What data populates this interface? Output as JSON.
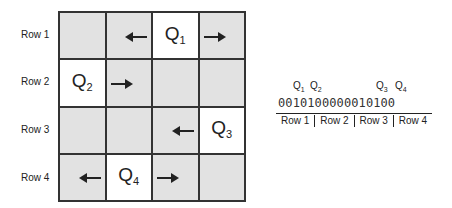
{
  "board": {
    "row_labels": [
      "Row 1",
      "Row 2",
      "Row 3",
      "Row 4"
    ],
    "queens": [
      {
        "label": "Q",
        "index": "1",
        "row": 1,
        "col": 3
      },
      {
        "label": "Q",
        "index": "2",
        "row": 2,
        "col": 1
      },
      {
        "label": "Q",
        "index": "3",
        "row": 3,
        "col": 4
      },
      {
        "label": "Q",
        "index": "4",
        "row": 4,
        "col": 2
      }
    ],
    "colors": {
      "empty_cell": "#e2e2e2",
      "queen_cell": "#ffffff",
      "grid_line": "#333333"
    }
  },
  "encoding": {
    "queen_markers": [
      "Q1",
      "Q2",
      "Q3",
      "Q4"
    ],
    "bits": "0010100000010100",
    "segments": [
      "Row 1",
      "Row 2",
      "Row 3",
      "Row 4"
    ]
  }
}
